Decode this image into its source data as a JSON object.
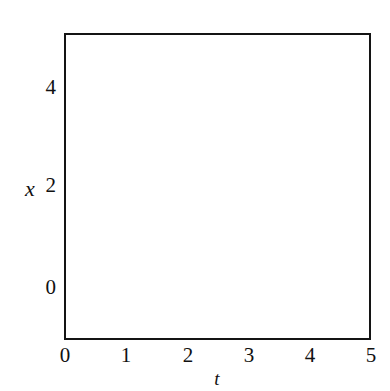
{
  "chart_data": {
    "type": "line",
    "title": "",
    "subtitle": "",
    "xlabel": "t",
    "ylabel": "x",
    "xlim": [
      0,
      5
    ],
    "ylim": [
      -0.92,
      5.12
    ],
    "grid": false,
    "legend": "none",
    "xticks": [
      0,
      1,
      2,
      3,
      4,
      5
    ],
    "xtick_labels": [
      "0",
      "1",
      "2",
      "3",
      "4",
      "5"
    ],
    "yticks": [
      0,
      2,
      4
    ],
    "ytick_labels": [
      "0",
      "2",
      "4"
    ],
    "annotations": [
      "Solution curves of an autonomous ODE with equilibria at x = 0 (unstable) and x = 2 (stable)",
      "Curves starting above x = 2 blow up through the top of the frame",
      "Curves starting between x = 0 and x = 2 rise and approach x = 2 from below",
      "Curves starting below x = 0 fall away and exit the bottom of the frame"
    ],
    "equilibria": [
      {
        "name": "x = 0",
        "value": 0,
        "stability": "unstable",
        "style": "solid-heavy"
      },
      {
        "name": "x = 2",
        "value": 2,
        "stability": "stable",
        "style": "dotted-heavy"
      }
    ],
    "series": [
      {
        "name": "above-2-a",
        "style": "dashed",
        "x": [
          0.0,
          0.2,
          0.4,
          0.6,
          0.8,
          1.0,
          1.2,
          1.35,
          1.48,
          1.58,
          1.66,
          1.72,
          1.78
        ],
        "y": [
          2.55,
          2.7,
          2.88,
          3.1,
          3.4,
          3.8,
          4.35,
          4.75,
          5.0,
          5.08,
          5.1,
          5.11,
          5.12
        ]
      },
      {
        "name": "above-2-b",
        "style": "dashed",
        "x": [
          0.0,
          0.4,
          0.8,
          1.2,
          1.6,
          2.0,
          2.35,
          2.6,
          2.8,
          2.95,
          3.05,
          3.12
        ],
        "y": [
          2.3,
          2.42,
          2.56,
          2.74,
          2.98,
          3.32,
          3.8,
          4.3,
          4.75,
          5.0,
          5.08,
          5.12
        ]
      },
      {
        "name": "above-2-c",
        "style": "dashed",
        "x": [
          0.0,
          0.5,
          1.0,
          1.5,
          2.0,
          2.5,
          2.9,
          3.25,
          3.55,
          3.75,
          3.9,
          4.0
        ],
        "y": [
          2.2,
          2.27,
          2.35,
          2.46,
          2.6,
          2.82,
          3.08,
          3.45,
          3.95,
          4.45,
          4.9,
          5.12
        ]
      },
      {
        "name": "above-2-d",
        "style": "dashed",
        "x": [
          0.0,
          0.6,
          1.2,
          1.8,
          2.4,
          3.0,
          3.5,
          3.95,
          4.3,
          4.55,
          4.72,
          4.85,
          4.95
        ],
        "y": [
          2.08,
          2.11,
          2.14,
          2.18,
          2.24,
          2.33,
          2.46,
          2.68,
          3.0,
          3.45,
          3.95,
          4.55,
          5.12
        ]
      },
      {
        "name": "equilibrium-x2",
        "style": "dotted-heavy",
        "x": [
          0.0,
          1.0,
          2.0,
          3.0,
          4.0,
          5.0
        ],
        "y": [
          2.0,
          2.0,
          2.0,
          2.0,
          2.0,
          2.0
        ]
      },
      {
        "name": "below-2-a",
        "style": "dashed",
        "x": [
          0.0,
          0.15,
          0.35,
          0.6,
          0.9,
          1.3,
          1.8,
          2.4,
          3.1,
          3.9,
          4.5,
          5.0
        ],
        "y": [
          0.1,
          0.3,
          0.62,
          0.98,
          1.28,
          1.53,
          1.7,
          1.8,
          1.87,
          1.91,
          1.93,
          1.95
        ]
      },
      {
        "name": "below-2-b",
        "style": "dashed",
        "x": [
          1.22,
          1.35,
          1.55,
          1.8,
          2.1,
          2.5,
          3.0,
          3.6,
          4.2,
          4.7,
          5.0
        ],
        "y": [
          0.0,
          0.24,
          0.58,
          0.94,
          1.24,
          1.5,
          1.68,
          1.8,
          1.87,
          1.91,
          1.93
        ]
      },
      {
        "name": "below-2-c",
        "style": "dashed",
        "x": [
          2.42,
          2.55,
          2.75,
          3.0,
          3.3,
          3.7,
          4.2,
          4.7,
          5.0
        ],
        "y": [
          0.0,
          0.24,
          0.58,
          0.92,
          1.22,
          1.48,
          1.67,
          1.79,
          1.84
        ]
      },
      {
        "name": "below-2-d",
        "style": "dashed",
        "x": [
          3.58,
          3.72,
          3.92,
          4.18,
          4.48,
          4.85,
          5.0
        ],
        "y": [
          0.0,
          0.24,
          0.58,
          0.92,
          1.22,
          1.5,
          1.58
        ]
      },
      {
        "name": "equilibrium-x0",
        "style": "solid-heavy",
        "x": [
          0.0,
          1.0,
          2.0,
          3.0,
          4.0,
          5.0
        ],
        "y": [
          0.0,
          0.0,
          0.0,
          0.0,
          0.0,
          0.0
        ]
      },
      {
        "name": "below-0-a",
        "style": "dashed",
        "x": [
          1.22,
          1.28,
          1.34,
          1.4,
          1.46,
          1.52,
          1.57
        ],
        "y": [
          0.0,
          -0.18,
          -0.36,
          -0.55,
          -0.72,
          -0.85,
          -0.92
        ]
      },
      {
        "name": "below-0-b",
        "style": "dashed",
        "x": [
          2.42,
          2.48,
          2.54,
          2.6,
          2.66,
          2.72,
          2.77
        ],
        "y": [
          0.0,
          -0.18,
          -0.36,
          -0.55,
          -0.72,
          -0.85,
          -0.92
        ]
      },
      {
        "name": "below-0-c",
        "style": "dashed",
        "x": [
          3.58,
          3.64,
          3.7,
          3.76,
          3.82,
          3.88,
          3.93
        ],
        "y": [
          0.0,
          -0.18,
          -0.36,
          -0.55,
          -0.72,
          -0.85,
          -0.92
        ]
      }
    ],
    "colors": {
      "curve": "#3a3a3a",
      "axis": "#141414",
      "background": "#ffffff"
    }
  }
}
